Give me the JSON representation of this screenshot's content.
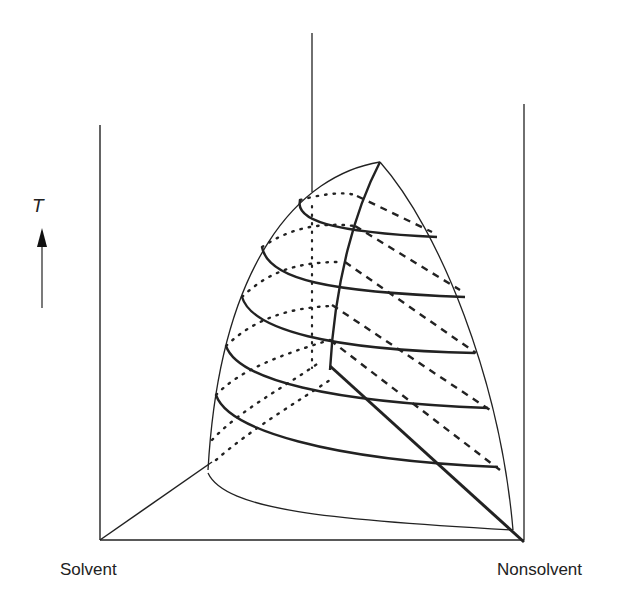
{
  "diagram": {
    "type": "ternary-phase-prism",
    "axis_label": "T",
    "axis_arrow": "arrow-up",
    "corner_labels": {
      "left": "Solvent",
      "right": "Nonsolvent"
    },
    "colors": {
      "ink": "#222222",
      "background": "#ffffff"
    },
    "line_styles": {
      "front_contours": "solid",
      "back_contours_left": "dotted",
      "back_contours_right": "dashed",
      "critical_line": "solid-thick"
    },
    "isotherm_count": 6
  }
}
